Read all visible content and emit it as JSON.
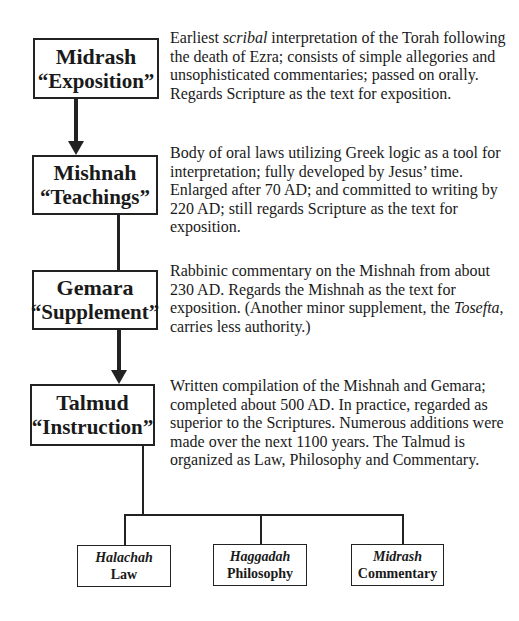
{
  "stages": [
    {
      "name": "Midrash",
      "subtitle": "“Exposition”",
      "description_parts": [
        "Earliest ",
        "scribal",
        " interpretation of the Torah following the death of Ezra; consists of simple allegories and unsophisticated commentaries; passed on orally. Regards Scripture as the text for exposition."
      ]
    },
    {
      "name": "Mishnah",
      "subtitle": "“Teachings”",
      "description": "Body of oral laws utilizing Greek logic as a tool for interpretation; fully developed by Jesus’ time. Enlarged after 70 AD; and committed to writing by 220 AD; still regards Scripture as the text for exposition."
    },
    {
      "name": "Gemara",
      "subtitle": "“Supplement”",
      "description_parts": [
        "Rabbinic commentary on the Mishnah from about 230 AD. Regards the Mishnah as the text for exposition. (Another minor supplement, the ",
        "Tosefta",
        ", carries less authority.)"
      ]
    },
    {
      "name": "Talmud",
      "subtitle": "“Instruction”",
      "description": "Written compilation of the Mishnah and Gemara; completed about 500 AD. In practice, regarded as superior to the Scriptures. Numerous additions were made over the next 1100 years. The Talmud is organized as Law, Philosophy and Commentary."
    }
  ],
  "divisions": [
    {
      "name": "Halachah",
      "subtitle": "Law"
    },
    {
      "name": "Haggadah",
      "subtitle": "Philosophy"
    },
    {
      "name": "Midrash",
      "subtitle": "Commentary"
    }
  ],
  "colors": {
    "line": "#222222",
    "text": "#1a1a1a",
    "background": "#ffffff"
  }
}
